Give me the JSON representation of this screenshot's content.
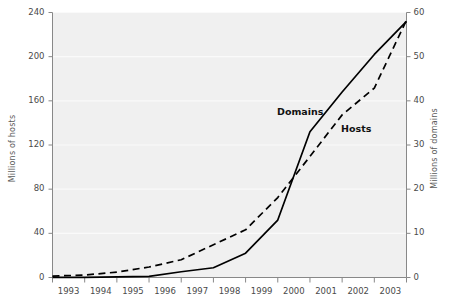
{
  "chart_data": {
    "type": "line",
    "title": "",
    "xlabel": "",
    "ylabel": "Millions of hosts",
    "y2label": "Millions of domains",
    "grid": true,
    "legend_position": "inline-annotation",
    "x": [
      1993,
      1994,
      1995,
      1996,
      1997,
      1998,
      1999,
      2000,
      2001,
      2002,
      2003,
      2004
    ],
    "xlim": [
      1993,
      2004
    ],
    "xtick_labels": [
      "1993",
      "1994",
      "1995",
      "1996",
      "1997",
      "1998",
      "1999",
      "2000",
      "2001",
      "2002",
      "2003"
    ],
    "ylim": [
      0,
      240
    ],
    "ytick_labels": [
      "0",
      "40",
      "80",
      "120",
      "160",
      "200",
      "240"
    ],
    "ytick_values": [
      0,
      40,
      80,
      120,
      160,
      200,
      240
    ],
    "y2lim": [
      0,
      60
    ],
    "y2tick_labels": [
      "0",
      "10",
      "20",
      "30",
      "40",
      "50",
      "60"
    ],
    "y2tick_values": [
      0,
      10,
      20,
      30,
      40,
      50,
      60
    ],
    "series": [
      {
        "name": "Hosts",
        "axis": "left",
        "units": "Millions of hosts",
        "style": "dashed",
        "color": "#000000",
        "annotation": "Hosts",
        "values": [
          1.3,
          2.2,
          4.9,
          9.5,
          16.1,
          29.7,
          43.2,
          72.4,
          109.6,
          147.3,
          171.6,
          233.1
        ]
      },
      {
        "name": "Domains",
        "axis": "right",
        "units": "Millions of domains",
        "style": "solid",
        "color": "#000000",
        "annotation": "Domains",
        "values": [
          0.02,
          0.05,
          0.12,
          0.25,
          1.3,
          2.2,
          5.5,
          13.0,
          33.0,
          42.0,
          50.5,
          58.0
        ]
      }
    ]
  },
  "annotations": {
    "domains_label": "Domains",
    "hosts_label": "Hosts"
  },
  "colors": {
    "plot_background": "#f0f0f0",
    "gridline": "#fafafa",
    "axis": "#888888",
    "line": "#111111",
    "tick_text": "#4a4a4a",
    "axis_title": "#5a5a5a"
  }
}
